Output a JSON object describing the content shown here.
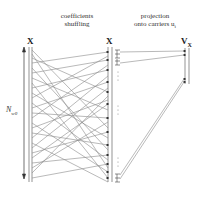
{
  "titles": {
    "shuffle_line1": "coefficients",
    "shuffle_line2": "shuffling",
    "project_line1": "projection",
    "project_line2": "onto carriers u",
    "project_sub": "i"
  },
  "columns": {
    "left": "X",
    "middle": "X",
    "right": "V",
    "right_sub": "X"
  },
  "axis_label": {
    "main": "N",
    "sub": "w0"
  },
  "colors": {
    "line": "#8a8a8a",
    "dark": "#333333"
  }
}
